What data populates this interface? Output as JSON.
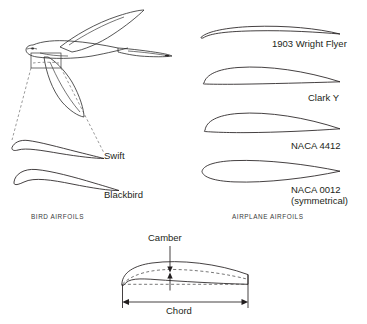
{
  "figure": {
    "background_color": "#ffffff",
    "ink_color": "#231f20"
  },
  "bird_panel": {
    "section_label": "BIRD AIRFOILS",
    "illustration_name": "flying-swift-bird",
    "inset_note": "callout box on the bird wing expands to the Swift airfoil section",
    "airfoils": [
      {
        "label": "Swift",
        "shape": "thin highly-cambered bird wing section"
      },
      {
        "label": "Blackbird",
        "shape": "thicker cambered bird wing section"
      }
    ]
  },
  "airplane_panel": {
    "section_label": "AIRPLANE AIRFOILS",
    "airfoils": [
      {
        "label": "1903 Wright Flyer",
        "sublabel": "",
        "shape": "very thin strongly cambered arc"
      },
      {
        "label": "Clark Y",
        "sublabel": "",
        "shape": "flat-bottomed cambered airfoil"
      },
      {
        "label": "NACA 4412",
        "sublabel": "",
        "shape": "cambered airfoil, 12% thickness, 4% camber"
      },
      {
        "label": "NACA 0012",
        "sublabel": "(symmetrical)",
        "shape": "symmetrical airfoil, 12% thickness"
      }
    ]
  },
  "definition_diagram": {
    "camber_label": "Camber",
    "chord_label": "Chord",
    "camber_line_style": "dashed",
    "chord_line_style": "dashed",
    "airfoil_shape": "cambered airfoil with mean camber line and chord line"
  }
}
